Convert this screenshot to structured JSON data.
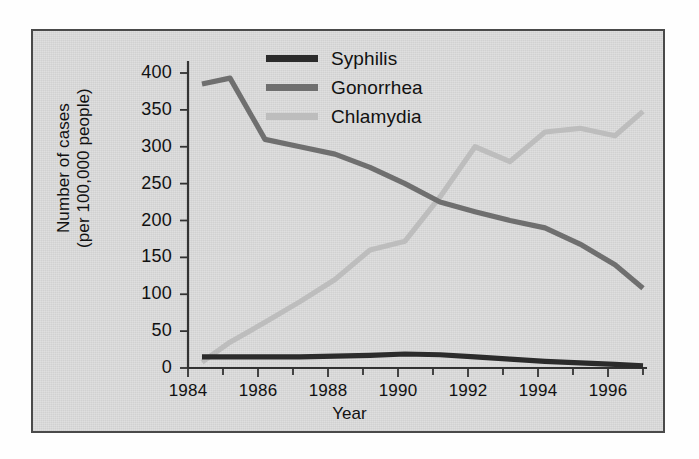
{
  "chart_data": {
    "type": "line",
    "title": "",
    "xlabel": "Year",
    "ylabel_line1": "Number of cases",
    "ylabel_line2": "(per 100,000 people)",
    "xlim": [
      1984,
      1997
    ],
    "ylim": [
      0,
      400
    ],
    "yticks": [
      400,
      350,
      300,
      250,
      200,
      150,
      100,
      50,
      0
    ],
    "xticks": [
      1984,
      1986,
      1988,
      1990,
      1992,
      1994,
      1996
    ],
    "x": [
      1984.4,
      1985.2,
      1986.2,
      1987.2,
      1988.2,
      1989.2,
      1990.2,
      1991.2,
      1992.2,
      1993.2,
      1994.2,
      1995.2,
      1996.2,
      1997.0
    ],
    "grid": false,
    "legend_position": "top-center",
    "series": [
      {
        "name": "Syphilis",
        "color": "#2b2b2b",
        "values": [
          15,
          15,
          15,
          15,
          16,
          17,
          19,
          18,
          15,
          12,
          9,
          7,
          5,
          3
        ]
      },
      {
        "name": "Gonorrhea",
        "color": "#6f6f6f",
        "values": [
          385,
          393,
          310,
          300,
          290,
          272,
          250,
          225,
          212,
          200,
          190,
          168,
          140,
          108
        ]
      },
      {
        "name": "Chlamydia",
        "color": "#bdbdbd",
        "values": [
          8,
          35,
          62,
          90,
          120,
          160,
          172,
          232,
          300,
          280,
          320,
          325,
          315,
          348
        ]
      }
    ]
  },
  "legend": {
    "items": [
      {
        "label": "Syphilis",
        "color": "#2b2b2b"
      },
      {
        "label": "Gonorrhea",
        "color": "#6f6f6f"
      },
      {
        "label": "Chlamydia",
        "color": "#bdbdbd"
      }
    ]
  },
  "axes": {
    "x_title": "Year",
    "y_title_top": "Number of cases",
    "y_title_bottom": "(per 100,000 people)"
  }
}
